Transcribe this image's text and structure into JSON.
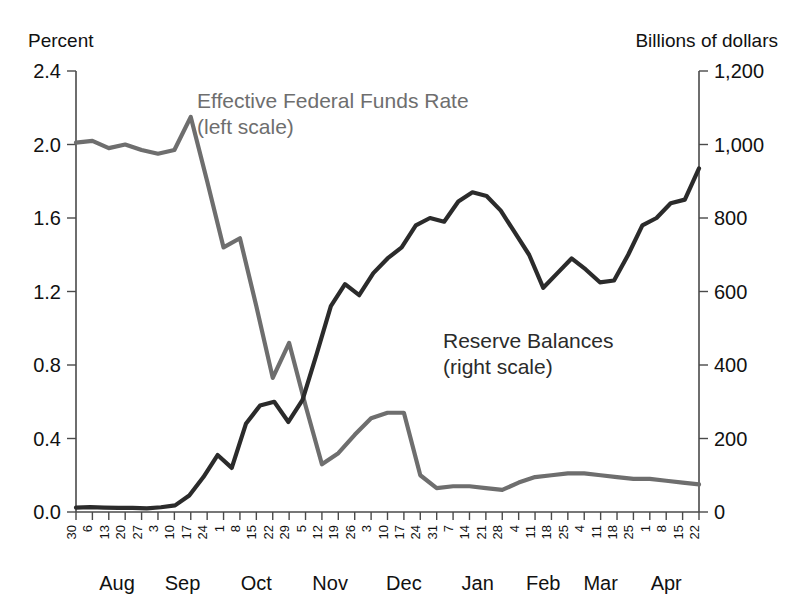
{
  "chart_data": {
    "type": "line",
    "title": "",
    "left_axis": {
      "label": "Percent",
      "ticks": [
        "2.4",
        "2.0",
        "1.6",
        "1.2",
        "0.8",
        "0.4",
        "0.0"
      ],
      "ylim": [
        0.0,
        2.4
      ]
    },
    "right_axis": {
      "label": "Billions of dollars",
      "ticks": [
        "1,200",
        "1,000",
        "800",
        "600",
        "400",
        "200",
        "0"
      ],
      "ylim": [
        0,
        1200
      ]
    },
    "xlabel": "",
    "grid": false,
    "legend_position": "inline-annotations",
    "annotations": [
      {
        "name": "effr-label",
        "line1": "Effective Federal Funds Rate",
        "line2": "(left scale)",
        "color": "#6e6e6e"
      },
      {
        "name": "reserve-label",
        "line1": "Reserve Balances",
        "line2": "(right scale)",
        "color": "#2b2b2b"
      }
    ],
    "x_tick_labels": [
      "30",
      "6",
      "13",
      "20",
      "27",
      "3",
      "10",
      "17",
      "24",
      "1",
      "8",
      "15",
      "22",
      "29",
      "5",
      "12",
      "19",
      "26",
      "3",
      "10",
      "17",
      "24",
      "31",
      "7",
      "14",
      "21",
      "28",
      "4",
      "11",
      "18",
      "25",
      "4",
      "11",
      "18",
      "25",
      "1",
      "8",
      "15",
      "22"
    ],
    "month_labels": [
      "Aug",
      "Sep",
      "Oct",
      "Nov",
      "Dec",
      "Jan",
      "Feb",
      "Mar",
      "Apr"
    ],
    "month_tick_index": [
      2.5,
      6.5,
      11.0,
      15.5,
      20.0,
      24.5,
      28.5,
      32.0,
      36.0
    ],
    "series": [
      {
        "name": "Effective Federal Funds Rate",
        "scale": "left",
        "color": "#6e6e6e",
        "unit": "percent",
        "values": [
          2.01,
          2.02,
          1.98,
          2.0,
          1.97,
          1.95,
          1.97,
          2.15,
          1.8,
          1.44,
          1.49,
          1.12,
          0.73,
          0.92,
          0.58,
          0.26,
          0.32,
          0.42,
          0.51,
          0.54,
          0.54,
          0.2,
          0.13,
          0.14,
          0.14,
          0.13,
          0.12,
          0.16,
          0.19,
          0.2,
          0.21,
          0.21,
          0.2,
          0.19,
          0.18,
          0.18,
          0.17,
          0.16,
          0.15
        ]
      },
      {
        "name": "Reserve Balances",
        "scale": "right",
        "color": "#2b2b2b",
        "unit": "billions",
        "values": [
          12,
          13,
          12,
          11,
          11,
          10,
          13,
          18,
          45,
          95,
          155,
          120,
          240,
          290,
          300,
          245,
          305,
          430,
          560,
          620,
          590,
          650,
          690,
          720,
          780,
          800,
          790,
          845,
          870,
          860,
          820,
          760,
          700,
          610,
          650,
          690,
          660,
          625,
          630,
          700,
          780,
          800,
          840,
          850,
          935
        ]
      }
    ]
  }
}
